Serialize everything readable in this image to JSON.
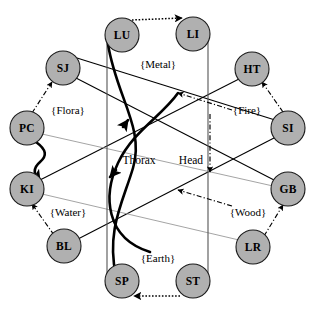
{
  "diagram": {
    "center_labels": [
      {
        "id": "thorax",
        "text": "Thorax",
        "x": 139,
        "y": 160
      },
      {
        "id": "head",
        "text": "Head",
        "x": 191,
        "y": 160
      }
    ],
    "nodes": [
      {
        "id": "lu",
        "label": "LU",
        "x": 122,
        "y": 35,
        "r": 17
      },
      {
        "id": "li",
        "label": "LI",
        "x": 193,
        "y": 34,
        "r": 17
      },
      {
        "id": "ht",
        "label": "HT",
        "x": 252,
        "y": 69,
        "r": 17
      },
      {
        "id": "si",
        "label": "SI",
        "x": 288,
        "y": 128,
        "r": 17
      },
      {
        "id": "gb",
        "label": "GB",
        "x": 288,
        "y": 189,
        "r": 17
      },
      {
        "id": "lr",
        "label": "LR",
        "x": 253,
        "y": 247,
        "r": 17
      },
      {
        "id": "st",
        "label": "ST",
        "x": 193,
        "y": 281,
        "r": 17
      },
      {
        "id": "sp",
        "label": "SP",
        "x": 122,
        "y": 281,
        "r": 17
      },
      {
        "id": "bl",
        "label": "BL",
        "x": 64,
        "y": 246,
        "r": 17
      },
      {
        "id": "ki",
        "label": "KI",
        "x": 27,
        "y": 189,
        "r": 17
      },
      {
        "id": "pc",
        "label": "PC",
        "x": 27,
        "y": 128,
        "r": 17
      },
      {
        "id": "sj",
        "label": "SJ",
        "x": 63,
        "y": 68,
        "r": 17
      }
    ],
    "element_labels": [
      {
        "id": "metal",
        "text": "{Metal}",
        "x": 158,
        "y": 64
      },
      {
        "id": "fire",
        "text": "{Fire}",
        "x": 247,
        "y": 110
      },
      {
        "id": "wood",
        "text": "{Wood}",
        "x": 248,
        "y": 212
      },
      {
        "id": "earth",
        "text": "{Earth}",
        "x": 158,
        "y": 258
      },
      {
        "id": "water",
        "text": "{Water}",
        "x": 68,
        "y": 212
      },
      {
        "id": "flora",
        "text": "{Flora}",
        "x": 68,
        "y": 110
      }
    ],
    "pair_arrows": [
      {
        "id": "lu-to-li",
        "from": "lu",
        "to": "li",
        "style": "dotted"
      },
      {
        "id": "si-to-ht",
        "from": "si",
        "to": "ht",
        "style": "dashdot"
      },
      {
        "id": "lr-to-gb",
        "from": "lr",
        "to": "gb",
        "style": "dashdot"
      },
      {
        "id": "st-to-sp",
        "from": "st",
        "to": "sp",
        "style": "dotted"
      },
      {
        "id": "bl-to-ki",
        "from": "bl",
        "to": "ki",
        "style": "dashdot"
      },
      {
        "id": "pc-to-sj",
        "from": "pc",
        "to": "sj",
        "style": "dashdot"
      }
    ],
    "star_edges": [
      {
        "id": "sj-to-si",
        "from": "sj",
        "to": "si",
        "style": "solid"
      },
      {
        "id": "ht-to-ki",
        "from": "ht",
        "to": "ki",
        "style": "solid"
      },
      {
        "id": "bl-to-si",
        "from": "bl",
        "to": "si",
        "style": "solid"
      },
      {
        "id": "gb-to-sj",
        "from": "gb",
        "to": "sj",
        "style": "solid"
      },
      {
        "id": "pc-to-gb",
        "from": "pc",
        "to": "gb",
        "style": "gray"
      },
      {
        "id": "ki-to-lr",
        "from": "ki",
        "to": "lr",
        "style": "gray"
      },
      {
        "id": "lu-to-sp",
        "from": "lu",
        "to": "sp",
        "style": "vertical"
      },
      {
        "id": "li-to-st",
        "from": "li",
        "to": "st",
        "style": "vertical"
      }
    ],
    "curve_arrows": [
      {
        "id": "thorax-curve",
        "style": "thick-curve"
      },
      {
        "id": "pc-ki-curve",
        "style": "thick-curve"
      },
      {
        "id": "head-dashdot-vertical",
        "style": "dashdot-arrow"
      },
      {
        "id": "head-upper-dashdot",
        "style": "dashdot-arrow"
      },
      {
        "id": "head-lower-dashdot",
        "style": "dashdot-arrow"
      }
    ],
    "caption": ""
  },
  "colors": {
    "node_fill": "#b0b0b0",
    "node_stroke": "#1a1a1a",
    "line": "#000000",
    "line_gray": "#9a9a9a",
    "background": "#ffffff"
  }
}
